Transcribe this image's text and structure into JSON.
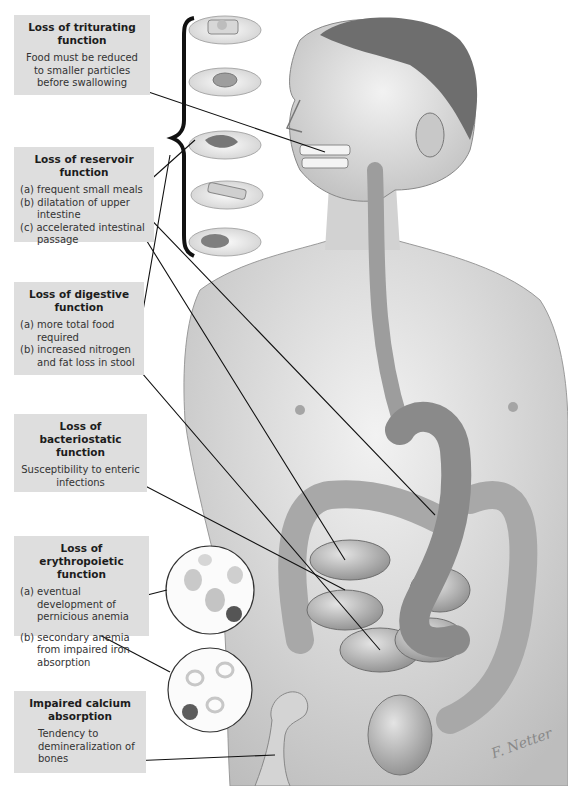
{
  "boxes": [
    {
      "id": "triturating",
      "title": "Loss of triturating function",
      "lines": [
        "Food must be reduced to smaller particles before swallowing"
      ]
    },
    {
      "id": "reservoir",
      "title": "Loss of reservoir function",
      "items": [
        "(a) frequent small meals",
        "(b) dilatation of upper intestine",
        "(c) accelerated intestinal passage"
      ]
    },
    {
      "id": "digestive",
      "title": "Loss of digestive function",
      "items": [
        "(a) more total food required",
        "(b) increased nitrogen and fat loss in stool"
      ]
    },
    {
      "id": "bacteriostatic",
      "title": "Loss of bacteriostatic function",
      "lines": [
        "Susceptibility to enteric infections"
      ]
    },
    {
      "id": "erythropoietic",
      "title": "Loss of erythropoietic function",
      "items": [
        "(a) eventual development of pernicious anemia",
        "(b) secondary anemia from impaired iron absorption"
      ]
    },
    {
      "id": "calcium",
      "title": "Impaired calcium absorption",
      "lines": [
        "Tendency to demineralization of bones"
      ]
    }
  ],
  "illustration": {
    "subject": "male torso with gastrectomy anatomy (esophagus joined to jejunum, small and large intestine)",
    "food_plates": [
      "toast with fried egg",
      "doughnut",
      "meat with vegetables",
      "sandwich",
      "meat with side"
    ],
    "insets": [
      "blood smear - megaloblasts",
      "blood smear - hypochromic cells"
    ],
    "bone": "femur head"
  },
  "signature": "F. Netter",
  "colors": {
    "box_bg": "#dedede",
    "text": "#1c1c1c",
    "skin": "#d9d9d9",
    "line": "#111111"
  }
}
